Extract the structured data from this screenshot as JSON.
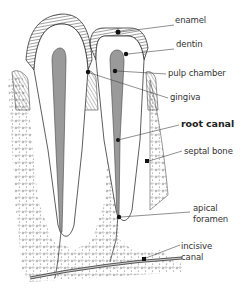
{
  "diagram": {
    "labels": [
      {
        "id": "enamel",
        "text": "enamel",
        "x": 175,
        "y": 20,
        "bold": false
      },
      {
        "id": "dentin",
        "text": "dentin",
        "x": 176,
        "y": 44,
        "bold": false
      },
      {
        "id": "pulp-chamber",
        "text": "pulp chamber",
        "x": 168,
        "y": 69,
        "bold": false
      },
      {
        "id": "gingiva",
        "text": "gingiva",
        "x": 170,
        "y": 93,
        "bold": false
      },
      {
        "id": "root-canal",
        "text": "root canal",
        "x": 181,
        "y": 120,
        "bold": true
      },
      {
        "id": "septal-bone",
        "text": "septal bone",
        "x": 184,
        "y": 147,
        "bold": false
      },
      {
        "id": "apical-foramen-1",
        "text": "apical",
        "x": 193,
        "y": 204,
        "bold": false
      },
      {
        "id": "apical-foramen-2",
        "text": "foramen",
        "x": 193,
        "y": 215,
        "bold": false
      },
      {
        "id": "incisive-canal-1",
        "text": "incisive",
        "x": 181,
        "y": 242,
        "bold": false
      },
      {
        "id": "incisive-canal-2",
        "text": "canal",
        "x": 181,
        "y": 253,
        "bold": false
      }
    ],
    "colors": {
      "outline": "#333333",
      "pulp": "#9a9a9a",
      "text": "#333333",
      "background": "#ffffff"
    }
  }
}
